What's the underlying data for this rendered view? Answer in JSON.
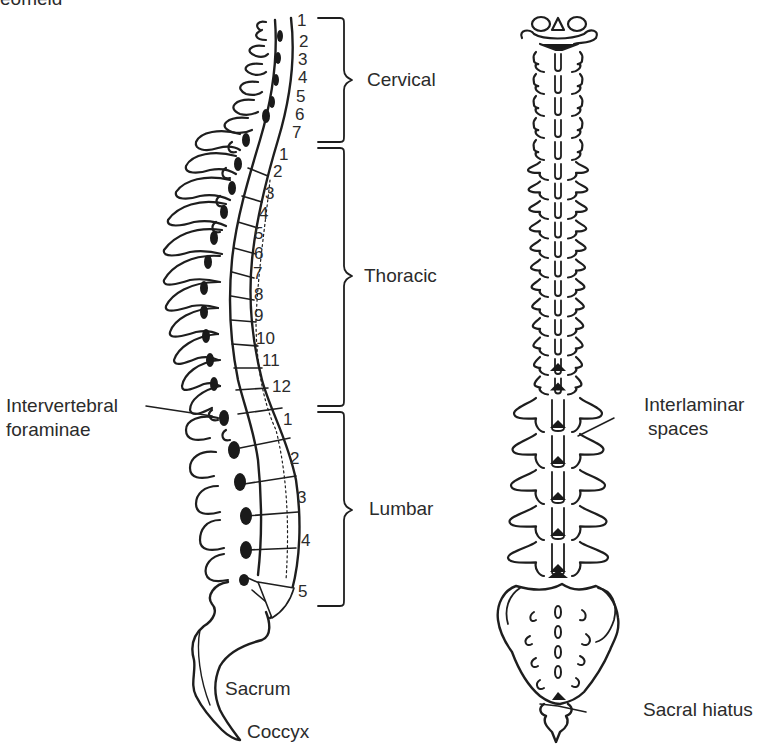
{
  "figure": {
    "cut_off_text": "Sacroiliac (partial, cropped)",
    "cut_off_visible": "eomeid"
  },
  "lateral_view": {
    "regions": [
      {
        "name": "Cervical",
        "vertebrae": [
          "1",
          "2",
          "3",
          "4",
          "5",
          "6",
          "7"
        ]
      },
      {
        "name": "Thoracic",
        "vertebrae": [
          "1",
          "2",
          "3",
          "4",
          "5",
          "6",
          "7",
          "8",
          "9",
          "10",
          "11",
          "12"
        ]
      },
      {
        "name": "Lumbar",
        "vertebrae": [
          "1",
          "2",
          "3",
          "4",
          "5"
        ]
      }
    ],
    "labels": {
      "intervertebral_line1": "Intervertebral",
      "intervertebral_line2": "foraminae",
      "sacrum": "Sacrum",
      "coccyx": "Coccyx"
    }
  },
  "posterior_view": {
    "labels": {
      "interlaminar_line1": "Interlaminar",
      "interlaminar_line2": "spaces",
      "sacral_hiatus": "Sacral hiatus"
    }
  },
  "colors": {
    "ink": "#1e1e1e",
    "text": "#2b2b2b",
    "background": "#ffffff"
  }
}
